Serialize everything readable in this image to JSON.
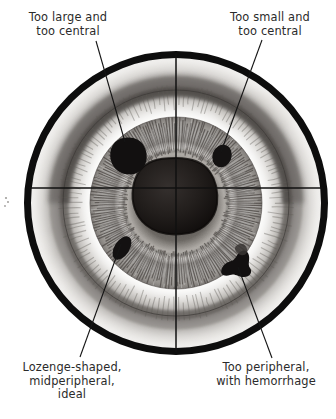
{
  "figure": {
    "colors": {
      "ink": "#0d0d0d",
      "text": "#2b2b2b",
      "background": "#ffffff",
      "iris_light": "#f2f0ee",
      "iris_mid": "#8d8a86",
      "iris_dark": "#4a4744",
      "pupil": "#1a1716",
      "lesion": "#111111"
    },
    "geometry": {
      "circle_center_x": 176,
      "circle_center_y": 203,
      "circle_radius": 150,
      "circle_stroke_width": 7,
      "limbus_radius": 118,
      "iris_outer_radius": 86,
      "pupil_radius": 45,
      "crosshair_horizontal_y": 188,
      "crosshair_vertical_x": 176
    },
    "labels": [
      {
        "id": "too-large-too-central",
        "text": "Too large and\ntoo central",
        "position": "top-left",
        "leader": {
          "x1": 96,
          "y1": 41,
          "x2": 125,
          "y2": 142
        }
      },
      {
        "id": "too-small-too-central",
        "text": "Too small and\ntoo central",
        "position": "top-right",
        "leader": {
          "x1": 262,
          "y1": 40,
          "x2": 221,
          "y2": 152
        }
      },
      {
        "id": "lozenge-midperipheral-ideal",
        "text": "Lozenge-shaped,\nmidperipheral,\nideal",
        "position": "bottom-left",
        "leader": {
          "x1": 121,
          "y1": 244,
          "x2": 80,
          "y2": 357
        }
      },
      {
        "id": "too-peripheral-hemorrhage",
        "text": "Too peripheral,\nwith hemorrhage",
        "position": "bottom-right",
        "leader": {
          "x1": 238,
          "y1": 267,
          "x2": 272,
          "y2": 358
        }
      }
    ],
    "lesions": [
      {
        "id": "lesion-too-large",
        "cx": 130,
        "cy": 150,
        "rx": 15,
        "ry": 13,
        "rotation": -28
      },
      {
        "id": "lesion-too-small",
        "cx": 222,
        "cy": 155,
        "rx": 9,
        "ry": 11,
        "rotation": 18
      },
      {
        "id": "lesion-lozenge-ideal",
        "cx": 122,
        "cy": 247,
        "rx": 8,
        "ry": 13,
        "rotation": 28
      },
      {
        "id": "lesion-too-peripheral",
        "cx": 240,
        "cy": 262,
        "rx": 16,
        "ry": 12,
        "rotation": 0
      }
    ]
  }
}
